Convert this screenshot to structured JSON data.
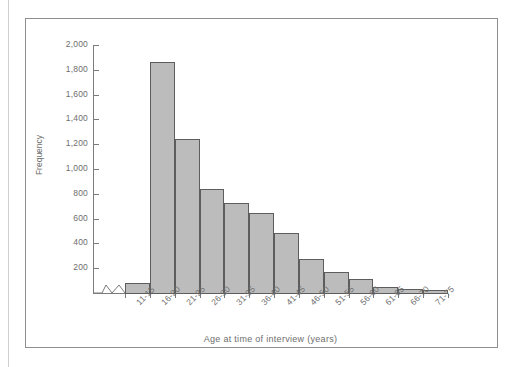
{
  "chart_data": {
    "type": "bar",
    "title": "",
    "subtitle": "",
    "xlabel": "Age at time of interview (years)",
    "ylabel": "Frequency",
    "categories": [
      "11-15",
      "16-20",
      "21-25",
      "26-30",
      "31-35",
      "36-40",
      "41-45",
      "46-50",
      "51-55",
      "56-60",
      "61-65",
      "66-70",
      "71-75"
    ],
    "values": [
      90,
      1870,
      1250,
      850,
      730,
      650,
      490,
      280,
      180,
      120,
      60,
      40,
      30
    ],
    "ylim": [
      0,
      2000
    ],
    "y_ticks": [
      200,
      400,
      600,
      800,
      1000,
      1200,
      1400,
      1600,
      1800,
      2000
    ],
    "y_tick_labels": [
      "200",
      "400",
      "600",
      "800",
      "1,000",
      "1,200",
      "1,400",
      "1,600",
      "1,800",
      "2,000"
    ],
    "grid": false,
    "legend": "none",
    "axis_break": "x-axis break between origin and first bar",
    "colors": {
      "bar_fill": "#bcbcbc",
      "bar_border": "#5d5d5d",
      "axis": "#7c7c7c",
      "text": "#6e6e6e",
      "frame": "#8e8e8e",
      "background": "#ffffff"
    }
  }
}
